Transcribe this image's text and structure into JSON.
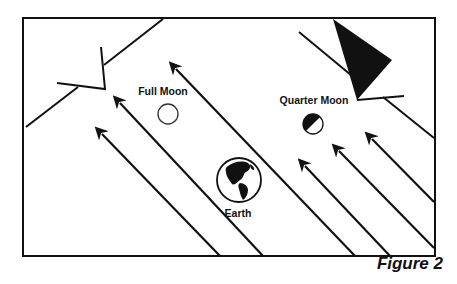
{
  "figure": {
    "caption": "Figure 2",
    "labels": {
      "full_moon": "Full Moon",
      "quarter_moon": "Quarter Moon",
      "earth": "Earth"
    },
    "colors": {
      "ink": "#111111",
      "background": "#ffffff"
    },
    "elements": {
      "sunlight_arrows_count": 6,
      "arrow_direction": "up-left"
    }
  }
}
